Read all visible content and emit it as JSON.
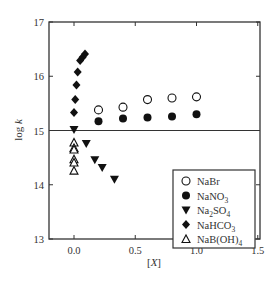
{
  "chart_data": {
    "type": "scatter",
    "title": "",
    "xlabel": "[X]",
    "ylabel": "log k",
    "xlim": [
      -0.2,
      1.5
    ],
    "ylim": [
      13,
      17
    ],
    "xticks": [
      0.0,
      0.5,
      1.0,
      1.5
    ],
    "xtick_labels": [
      "0.0",
      "0.5",
      "1.0",
      "1.5"
    ],
    "yticks": [
      13,
      14,
      15,
      16,
      17
    ],
    "ytick_labels": [
      "13",
      "14",
      "15",
      "16",
      "17"
    ],
    "grid": false,
    "reference_line": {
      "y": 15.0,
      "orientation": "horizontal"
    },
    "legend_position": "lower right (inside)",
    "series": [
      {
        "name": "NaBr",
        "label_parts": [
          [
            "NaBr",
            ""
          ]
        ],
        "marker": "open-circle",
        "x": [
          0.2,
          0.4,
          0.6,
          0.8,
          1.0
        ],
        "y": [
          15.38,
          15.43,
          15.57,
          15.6,
          15.62
        ]
      },
      {
        "name": "NaNO3",
        "label_parts": [
          [
            "NaNO",
            ""
          ],
          [
            "3",
            "sub"
          ]
        ],
        "marker": "filled-circle",
        "x": [
          0.2,
          0.4,
          0.6,
          0.8,
          1.0
        ],
        "y": [
          15.17,
          15.22,
          15.24,
          15.26,
          15.3
        ]
      },
      {
        "name": "Na2SO4",
        "label_parts": [
          [
            "Na",
            ""
          ],
          [
            "2",
            "sub"
          ],
          [
            "SO",
            ""
          ],
          [
            "4",
            "sub"
          ]
        ],
        "marker": "filled-triangle-down",
        "x": [
          0.0,
          0.1,
          0.17,
          0.23,
          0.33
        ],
        "y": [
          15.02,
          14.76,
          14.46,
          14.32,
          14.1
        ]
      },
      {
        "name": "NaHCO3",
        "label_parts": [
          [
            "NaHCO",
            ""
          ],
          [
            "3",
            "sub"
          ]
        ],
        "marker": "filled-diamond",
        "x": [
          0.0,
          0.01,
          0.02,
          0.03,
          0.05,
          0.07,
          0.09
        ],
        "y": [
          15.33,
          15.57,
          15.84,
          16.08,
          16.29,
          16.35,
          16.41
        ]
      },
      {
        "name": "NaB(OH)4",
        "label_parts": [
          [
            "NaB(OH)",
            ""
          ],
          [
            "4",
            "sub"
          ]
        ],
        "marker": "open-triangle-up",
        "x": [
          0.0,
          0.0,
          0.0,
          0.0,
          0.0,
          0.0
        ],
        "y": [
          14.78,
          14.68,
          14.47,
          14.41,
          14.26,
          14.65
        ]
      }
    ]
  },
  "axes": {
    "xlabel": "[X]",
    "ylabel": "log k"
  }
}
